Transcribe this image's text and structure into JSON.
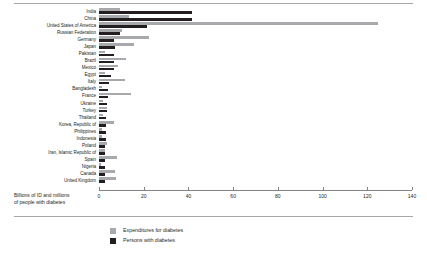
{
  "chart_data": {
    "type": "bar",
    "orientation": "horizontal",
    "title": "",
    "xlabel": "Billions of ID and millions of people with diabetes",
    "ylabel": "",
    "xlim": [
      0,
      140
    ],
    "xticks": [
      0,
      20,
      40,
      60,
      80,
      100,
      120,
      140
    ],
    "grid": false,
    "legend_position": "bottom",
    "categories": [
      "India",
      "China",
      "United States of America",
      "Russian Federation",
      "Germany",
      "Japan",
      "Pakistan",
      "Brazil",
      "Mexico",
      "Egypt",
      "Italy",
      "Bangladesh",
      "France",
      "Ukraine",
      "Turkey",
      "Thailand",
      "Korea, Republic of",
      "Philippines",
      "Indonesia",
      "Poland",
      "Iran, Islamic Republic of",
      "Spain",
      "Nigeria",
      "Canada",
      "United Kingdom"
    ],
    "series": [
      {
        "name": "Expenditures for diabetes",
        "color": "#a7a9ac",
        "values": [
          9.5,
          13.5,
          125.0,
          10.5,
          22.5,
          15.5,
          2.5,
          12.0,
          8.5,
          2.5,
          11.5,
          1.5,
          14.5,
          2.0,
          3.5,
          2.0,
          6.5,
          1.5,
          1.5,
          3.5,
          2.5,
          8.0,
          1.0,
          7.0,
          7.5
        ]
      },
      {
        "name": "Persons with diabetes",
        "color": "#231f20",
        "values": [
          41.5,
          41.5,
          21.5,
          9.5,
          6.5,
          7.0,
          6.5,
          6.5,
          6.5,
          5.5,
          4.5,
          4.0,
          4.0,
          3.5,
          3.5,
          3.0,
          3.0,
          3.0,
          3.0,
          2.5,
          2.5,
          2.5,
          2.5,
          2.5,
          2.5
        ]
      }
    ],
    "legend": [
      {
        "label": "Expenditures for diabetes",
        "color": "#a7a9ac",
        "swatch": "exp"
      },
      {
        "label": "Persons with diabetes",
        "color": "#231f20",
        "swatch": "per"
      }
    ],
    "axis_title_lines": [
      "Billions of ID and millions",
      "of people with diabetes"
    ]
  }
}
